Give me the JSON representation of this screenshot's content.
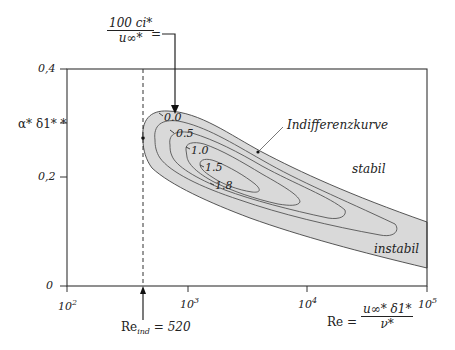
{
  "diagram": {
    "type": "stability-diagram",
    "y_axis": {
      "label": "α* δ1* *",
      "ticks": [
        "0",
        "0,2",
        "0,4"
      ]
    },
    "x_axis": {
      "ticks": [
        "10",
        "10",
        "10",
        "10"
      ],
      "tick_exponents": [
        "2",
        "3",
        "4",
        "5"
      ],
      "label_lhs": "Re =",
      "label_num": "u∞* δ1*",
      "label_den": "ν*"
    },
    "top_annotation": {
      "num": "100 ci*",
      "den": "u∞*",
      "eq": "="
    },
    "contours": [
      "0.0",
      "0.5",
      "1.0",
      "1.5",
      "1.8"
    ],
    "region_labels": {
      "neutral_curve": "Indifferenzkurve",
      "stable": "stabil",
      "unstable": "instabil"
    },
    "critical": {
      "label": "Re",
      "sub": "ind",
      "value": "= 520"
    },
    "colors": {
      "unstable_fill": "#d9d9d9",
      "line": "#333333",
      "contour": "#555555"
    }
  }
}
